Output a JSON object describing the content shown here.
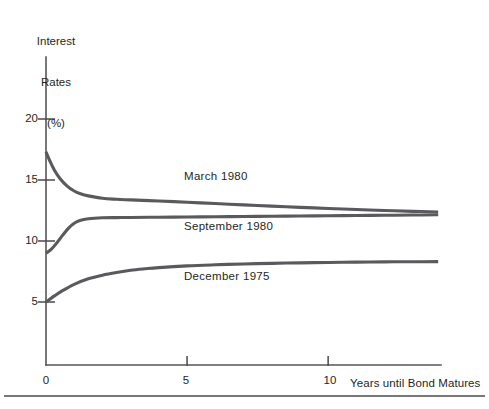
{
  "chart_data": {
    "type": "line",
    "title": "",
    "subtitle": "",
    "xlabel": "Years until Bond Matures",
    "ylabel": "Interest Rates (%)",
    "ylabel_lines": [
      "Interest",
      "Rates",
      "(%)"
    ],
    "xlim": [
      0,
      14
    ],
    "ylim": [
      0,
      22
    ],
    "xticks": [
      0,
      5,
      10
    ],
    "xtick_labels": [
      "0",
      "5",
      "10"
    ],
    "yticks": [
      5,
      10,
      15,
      20
    ],
    "ytick_labels": [
      "5",
      "10",
      "15",
      "20"
    ],
    "grid": false,
    "legend": "inline-annotations",
    "legend_position": "inside-right-of-curves",
    "annotations": [
      {
        "text": "March 1980",
        "x": 5.0,
        "y": 15.0
      },
      {
        "text": "September 1980",
        "x": 5.0,
        "y": 11.0
      },
      {
        "text": "December 1975",
        "x": 5.0,
        "y": 7.0
      }
    ],
    "series": [
      {
        "name": "March 1980",
        "label": "March 1980",
        "color": "#5a5a5e",
        "x": [
          0,
          0.15,
          0.3,
          0.5,
          0.75,
          1.0,
          1.25,
          1.5,
          2.0,
          2.5,
          3.0,
          4.0,
          5.0,
          6.0,
          7.0,
          8.0,
          9.0,
          10.0,
          11.0,
          12.0,
          13.0,
          13.9
        ],
        "values": [
          17.3,
          16.5,
          15.8,
          15.1,
          14.5,
          14.1,
          13.85,
          13.7,
          13.5,
          13.42,
          13.37,
          13.28,
          13.18,
          13.07,
          12.96,
          12.86,
          12.76,
          12.67,
          12.58,
          12.5,
          12.43,
          12.38
        ]
      },
      {
        "name": "September 1980",
        "label": "September 1980",
        "color": "#5a5a5e",
        "x": [
          0,
          0.2,
          0.4,
          0.6,
          0.8,
          1.0,
          1.2,
          1.5,
          2.0,
          2.5,
          3.0,
          4.0,
          5.0,
          6.0,
          7.0,
          8.0,
          9.0,
          10.0,
          11.0,
          12.0,
          13.0,
          13.9
        ],
        "values": [
          9.0,
          9.35,
          9.9,
          10.5,
          11.05,
          11.45,
          11.68,
          11.82,
          11.9,
          11.92,
          11.93,
          11.95,
          11.97,
          11.99,
          12.01,
          12.03,
          12.05,
          12.07,
          12.09,
          12.11,
          12.13,
          12.15
        ]
      },
      {
        "name": "December 1975",
        "label": "December 1975",
        "color": "#5a5a5e",
        "x": [
          0,
          0.3,
          0.6,
          1.0,
          1.5,
          2.0,
          2.5,
          3.0,
          3.5,
          4.0,
          5.0,
          6.0,
          7.0,
          8.0,
          9.0,
          10.0,
          11.0,
          12.0,
          13.0,
          13.9
        ],
        "values": [
          5.0,
          5.5,
          5.95,
          6.45,
          6.9,
          7.2,
          7.42,
          7.6,
          7.72,
          7.82,
          7.96,
          8.05,
          8.12,
          8.17,
          8.21,
          8.24,
          8.27,
          8.29,
          8.3,
          8.31
        ]
      }
    ]
  },
  "axis": {
    "y_title_lines": [
      "Interest",
      "Rates",
      "(%)"
    ],
    "x_title": "Years until Bond Matures",
    "y_tick_labels": [
      "20",
      "15",
      "10",
      "5"
    ],
    "x_tick_labels": [
      "0",
      "5",
      "10"
    ]
  },
  "colors": {
    "line": "#5a5a5e",
    "axis": "#56565a",
    "text": "#1f1f22",
    "background": "#ffffff"
  }
}
